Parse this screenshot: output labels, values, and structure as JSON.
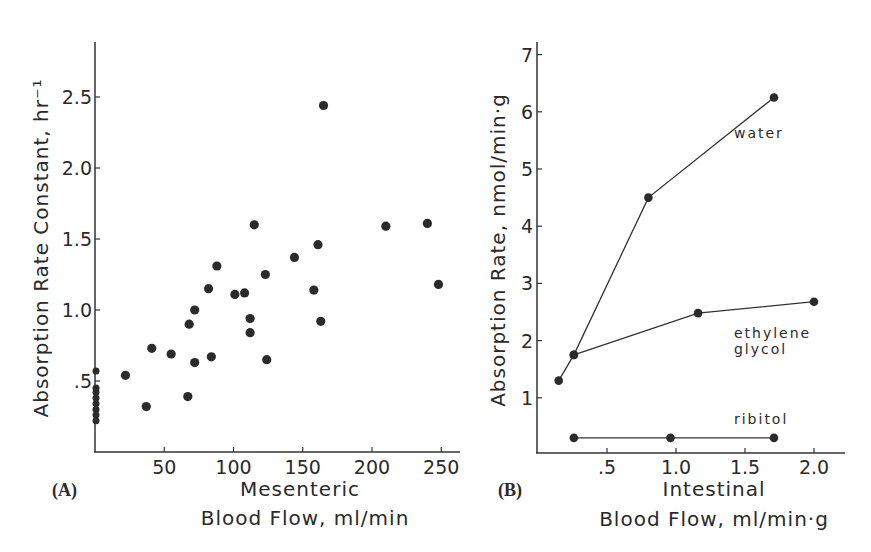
{
  "chart_data": [
    {
      "panel": "(A)",
      "type": "scatter",
      "title": "",
      "xlabel": "Mesenteric Blood Flow, ml/min",
      "xlabel_lines": [
        "Mesenteric",
        "Blood Flow, ml/min"
      ],
      "ylabel": "Absorption Rate Constant, hr⁻¹",
      "xticks": [
        "50",
        "100",
        "150",
        "200",
        "250"
      ],
      "xtick_values": [
        50,
        100,
        150,
        200,
        250
      ],
      "yticks": [
        ".5",
        "1.0",
        "1.5",
        "2.0",
        "2.5"
      ],
      "ytick_values": [
        0.5,
        1.0,
        1.5,
        2.0,
        2.5
      ],
      "xlim": [
        0,
        260
      ],
      "ylim": [
        0,
        2.9
      ],
      "grid": false,
      "points": [
        {
          "x": 0,
          "y": 0.57
        },
        {
          "x": 0,
          "y": 0.45
        },
        {
          "x": 0,
          "y": 0.42
        },
        {
          "x": 0,
          "y": 0.38
        },
        {
          "x": 0,
          "y": 0.34
        },
        {
          "x": 0,
          "y": 0.3
        },
        {
          "x": 0,
          "y": 0.26
        },
        {
          "x": 0,
          "y": 0.22
        },
        {
          "x": 22,
          "y": 0.54
        },
        {
          "x": 37,
          "y": 0.32
        },
        {
          "x": 41,
          "y": 0.73
        },
        {
          "x": 55,
          "y": 0.69
        },
        {
          "x": 67,
          "y": 0.39
        },
        {
          "x": 68,
          "y": 0.9
        },
        {
          "x": 72,
          "y": 1.0
        },
        {
          "x": 72,
          "y": 0.63
        },
        {
          "x": 82,
          "y": 1.15
        },
        {
          "x": 84,
          "y": 0.67
        },
        {
          "x": 88,
          "y": 1.31
        },
        {
          "x": 101,
          "y": 1.11
        },
        {
          "x": 108,
          "y": 1.12
        },
        {
          "x": 112,
          "y": 0.94
        },
        {
          "x": 112,
          "y": 0.84
        },
        {
          "x": 115,
          "y": 1.6
        },
        {
          "x": 123,
          "y": 1.25
        },
        {
          "x": 124,
          "y": 0.65
        },
        {
          "x": 144,
          "y": 1.37
        },
        {
          "x": 158,
          "y": 1.14
        },
        {
          "x": 161,
          "y": 1.46
        },
        {
          "x": 163,
          "y": 0.92
        },
        {
          "x": 165,
          "y": 2.44
        },
        {
          "x": 210,
          "y": 1.59
        },
        {
          "x": 240,
          "y": 1.61
        },
        {
          "x": 248,
          "y": 1.18
        }
      ]
    },
    {
      "panel": "(B)",
      "type": "line",
      "title": "",
      "xlabel": "Intestinal Blood Flow, ml/min·g",
      "xlabel_lines": [
        "Intestinal",
        "Blood Flow, ml/min·g"
      ],
      "ylabel": "Absorption Rate, nmol/min·g",
      "xticks": [
        ".5",
        "1.0",
        "1.5",
        "2.0"
      ],
      "xtick_values": [
        0.5,
        1.0,
        1.5,
        2.0
      ],
      "yticks": [
        "1",
        "2",
        "3",
        "4",
        "5",
        "6",
        "7"
      ],
      "ytick_values": [
        1,
        2,
        3,
        4,
        5,
        6,
        7
      ],
      "xlim": [
        0,
        2.2
      ],
      "ylim": [
        0,
        7.2
      ],
      "grid": false,
      "legend": "inline labels",
      "series": [
        {
          "name": "water",
          "x": [
            0.15,
            0.26,
            0.8,
            1.71
          ],
          "y": [
            1.3,
            1.75,
            4.5,
            6.25
          ],
          "label_pos": {
            "x": 1.42,
            "y": 5.55
          }
        },
        {
          "name": "ethylene glycol",
          "label_lines": [
            "ethylene",
            "glycol"
          ],
          "x": [
            0.26,
            1.16,
            2.0
          ],
          "y": [
            1.75,
            2.48,
            2.68
          ],
          "label_pos": {
            "x": 1.42,
            "y": 2.05
          }
        },
        {
          "name": "ribitol",
          "x": [
            0.26,
            0.96,
            1.71
          ],
          "y": [
            0.3,
            0.3,
            0.3
          ],
          "label_pos": {
            "x": 1.42,
            "y": 0.55
          }
        }
      ]
    }
  ]
}
